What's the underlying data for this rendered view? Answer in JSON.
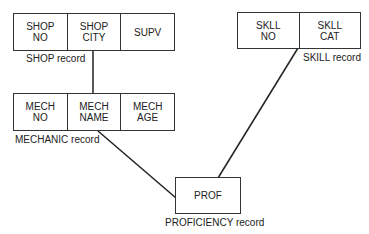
{
  "records": {
    "shop": {
      "fields": [
        "SHOP\nNO",
        "SHOP\nCITY",
        "SUPV"
      ],
      "label": "SHOP record"
    },
    "skill": {
      "fields": [
        "SKLL\nNO",
        "SKLL\nCAT"
      ],
      "label": "SKILL record"
    },
    "mechanic": {
      "fields": [
        "MECH\nNO",
        "MECH\nNAME",
        "MECH\nAGE"
      ],
      "label": "MECHANIC record"
    },
    "proficiency": {
      "fields": [
        "PROF"
      ],
      "label": "PROFICIENCY record"
    }
  },
  "links": [
    {
      "from": "shop.SHOP CITY",
      "to": "mechanic"
    },
    {
      "from": "mechanic.MECH NAME",
      "to": "proficiency"
    },
    {
      "from": "skill.SKLL NO/CAT boundary",
      "to": "proficiency"
    }
  ],
  "colors": {
    "line": "#222222",
    "background": "#ffffff"
  }
}
